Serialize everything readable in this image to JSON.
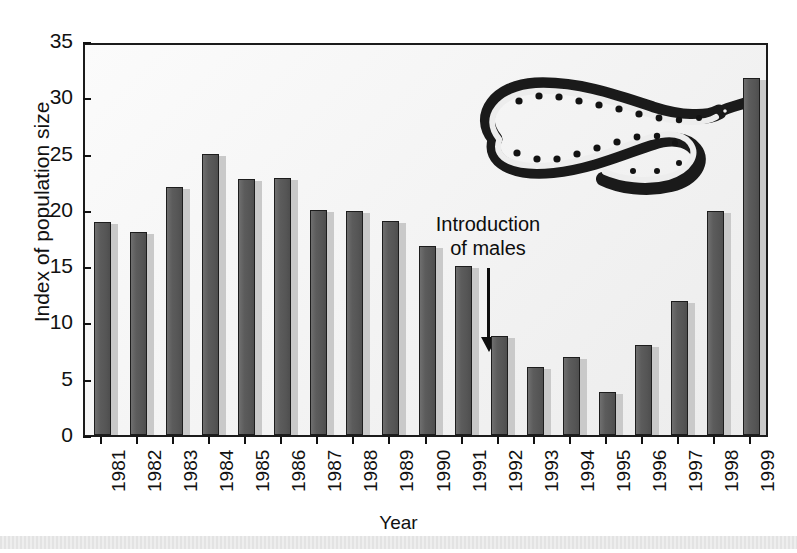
{
  "chart_data": {
    "type": "bar",
    "title": "",
    "xlabel": "Year",
    "ylabel": "Index of population size",
    "categories": [
      "1981",
      "1982",
      "1983",
      "1984",
      "1985",
      "1986",
      "1987",
      "1988",
      "1989",
      "1990",
      "1991",
      "1992",
      "1993",
      "1994",
      "1995",
      "1996",
      "1997",
      "1998",
      "1999"
    ],
    "values": [
      18.9,
      18.0,
      22.0,
      25.0,
      22.7,
      22.8,
      20.0,
      19.9,
      19.0,
      16.8,
      15.0,
      8.8,
      6.0,
      6.9,
      3.8,
      8.0,
      11.9,
      19.9,
      31.7
    ],
    "ylim": [
      0,
      35
    ],
    "yticks": [
      0,
      5,
      10,
      15,
      20,
      25,
      30,
      35
    ],
    "ytick_labels": [
      "0",
      "5",
      "10",
      "15",
      "20",
      "25",
      "30",
      "35"
    ],
    "grid": false,
    "legend": "none",
    "bar_color": "#575757",
    "bar_edge_color": "#1d1d1d",
    "shadow_color": "#c9c9c9",
    "plot_background": "#f2f2f2",
    "axis_color": "#1b1b1b",
    "annotations": [
      {
        "text_line1": "Introduction",
        "text_line2": "of males",
        "points_to_category": "1992",
        "arrow": "down-arrow"
      }
    ],
    "illustration": "snake-illustration"
  },
  "figure": {
    "y_axis_title": "Index of population size",
    "x_axis_title": "Year",
    "annotation_line1": "Introduction",
    "annotation_line2": "of males"
  }
}
